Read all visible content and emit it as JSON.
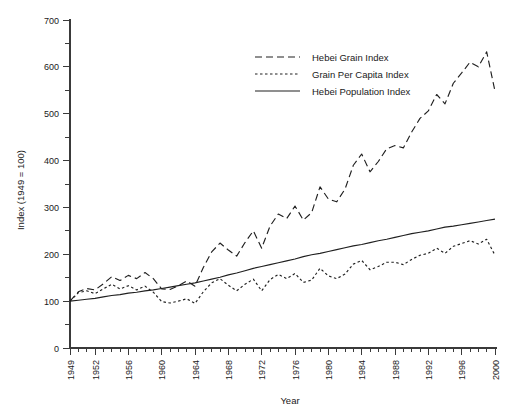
{
  "chart_data": {
    "type": "line",
    "title": "",
    "xlabel": "Year",
    "ylabel": "Index (1949 = 100)",
    "xlim": [
      1949,
      2000
    ],
    "ylim": [
      0,
      700
    ],
    "y_ticks": [
      0,
      100,
      200,
      300,
      400,
      500,
      600,
      700
    ],
    "y_minor_ticks": [
      50,
      150,
      250,
      350,
      450,
      550,
      650
    ],
    "x_ticks": [
      1949,
      1952,
      1956,
      1960,
      1964,
      1968,
      1972,
      1976,
      1980,
      1984,
      1988,
      1992,
      1996,
      2000
    ],
    "x_minor_tick_step": 1,
    "grid": false,
    "legend_position": "top-center",
    "x": [
      1949,
      1950,
      1951,
      1952,
      1953,
      1954,
      1955,
      1956,
      1957,
      1958,
      1959,
      1960,
      1961,
      1962,
      1963,
      1964,
      1965,
      1966,
      1967,
      1968,
      1969,
      1970,
      1971,
      1972,
      1973,
      1974,
      1975,
      1976,
      1977,
      1978,
      1979,
      1980,
      1981,
      1982,
      1983,
      1984,
      1985,
      1986,
      1987,
      1988,
      1989,
      1990,
      1991,
      1992,
      1993,
      1994,
      1995,
      1996,
      1997,
      1998,
      1999,
      2000
    ],
    "series": [
      {
        "name": "Hebei Grain Index",
        "style": "dashed",
        "values": [
          100,
          120,
          127,
          124,
          137,
          152,
          144,
          155,
          148,
          161,
          148,
          126,
          125,
          133,
          143,
          132,
          172,
          205,
          224,
          209,
          196,
          225,
          250,
          213,
          260,
          286,
          276,
          303,
          273,
          289,
          344,
          318,
          312,
          339,
          390,
          414,
          376,
          398,
          425,
          432,
          427,
          461,
          490,
          506,
          541,
          521,
          565,
          587,
          610,
          600,
          632,
          548
        ]
      },
      {
        "name": "Grain Per Capita Index",
        "style": "dotted",
        "values": [
          100,
          118,
          122,
          116,
          126,
          136,
          126,
          133,
          124,
          132,
          119,
          99,
          96,
          100,
          105,
          95,
          120,
          139,
          148,
          134,
          122,
          136,
          147,
          122,
          146,
          157,
          148,
          159,
          140,
          145,
          170,
          154,
          148,
          158,
          179,
          187,
          167,
          174,
          183,
          183,
          178,
          189,
          198,
          202,
          213,
          202,
          217,
          223,
          229,
          222,
          232,
          198
        ]
      },
      {
        "name": "Hebei Population Index",
        "style": "solid",
        "values": [
          100,
          102,
          104,
          106,
          109,
          112,
          114,
          117,
          119,
          122,
          124,
          127,
          130,
          133,
          136,
          139,
          143,
          147,
          151,
          156,
          160,
          165,
          170,
          174,
          178,
          182,
          186,
          190,
          195,
          199,
          202,
          206,
          210,
          214,
          218,
          221,
          225,
          229,
          232,
          236,
          240,
          244,
          247,
          250,
          254,
          258,
          260,
          263,
          266,
          269,
          272,
          275
        ]
      }
    ],
    "series_render": [
      {
        "name": "Hebei Grain Index",
        "legend_dash": "7,4"
      },
      {
        "name": "Grain Per Capita Index",
        "legend_dash": "2.5,2.5"
      },
      {
        "name": "Hebei Population Index",
        "legend_dash": "none"
      }
    ]
  },
  "legend": {
    "items": [
      {
        "label": "Hebei Grain Index"
      },
      {
        "label": "Grain Per Capita Index"
      },
      {
        "label": "Hebei Population Index"
      }
    ]
  },
  "axes": {
    "y_title": "Index (1949 = 100)",
    "x_title": "Year"
  }
}
